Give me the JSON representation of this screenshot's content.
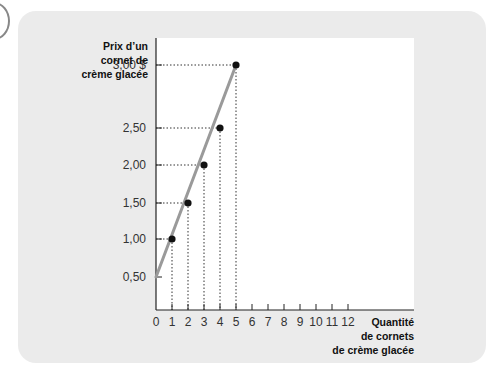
{
  "chart_data": {
    "type": "line",
    "title": "",
    "ylabel": [
      "Prix d’un",
      "cornet de",
      "crème glacée"
    ],
    "xlabel": [
      "Quantité",
      "de cornets",
      "de crème glacée"
    ],
    "xlim": [
      0,
      12
    ],
    "ylim": [
      0,
      3.0
    ],
    "x_ticks": [
      0,
      1,
      2,
      3,
      4,
      5,
      6,
      7,
      8,
      9,
      10,
      11,
      12
    ],
    "x_tick_labels": [
      "0",
      "1",
      "2",
      "3",
      "4",
      "5",
      "6",
      "7",
      "8",
      "9",
      "10",
      "11",
      "12"
    ],
    "y_ticks": [
      0.5,
      1.0,
      1.5,
      2.0,
      2.5,
      3.0
    ],
    "y_tick_labels": [
      "0,50",
      "1,00",
      "1,50",
      "2,00",
      "2,50",
      "3,00 $"
    ],
    "grid": false,
    "series": [
      {
        "name": "Offre",
        "line": {
          "x": [
            0,
            5
          ],
          "y": [
            0.5,
            3.0
          ]
        },
        "points": [
          {
            "x": 1,
            "y": 1.0
          },
          {
            "x": 2,
            "y": 1.5
          },
          {
            "x": 3,
            "y": 2.0
          },
          {
            "x": 4,
            "y": 2.5
          },
          {
            "x": 5,
            "y": 3.0
          }
        ]
      }
    ],
    "colors": {
      "line": "#9a9a9a",
      "points": "#111111",
      "panel": "#ebebeb",
      "plot": "#ffffff"
    }
  }
}
